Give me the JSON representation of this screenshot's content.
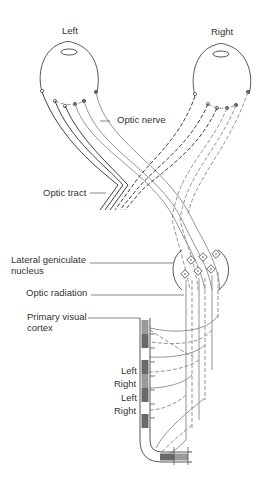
{
  "diagram": {
    "eyes": {
      "left_label": "Left",
      "right_label": "Right"
    },
    "labels": {
      "optic_nerve": "Optic nerve",
      "optic_tract": "Optic tract",
      "lgn_line1": "Lateral geniculate",
      "lgn_line2": "nucleus",
      "optic_radiation": "Optic radiation",
      "cortex_line1": "Primary visual",
      "cortex_line2": "cortex"
    },
    "cortex_columns": [
      "Left",
      "Right",
      "Left",
      "Right"
    ],
    "colors": {
      "line_dark": "#2a2a2a",
      "line_gray": "#888888",
      "cortex_fill": "#9a9a9a",
      "cortex_dark": "#6a6a6a"
    }
  }
}
